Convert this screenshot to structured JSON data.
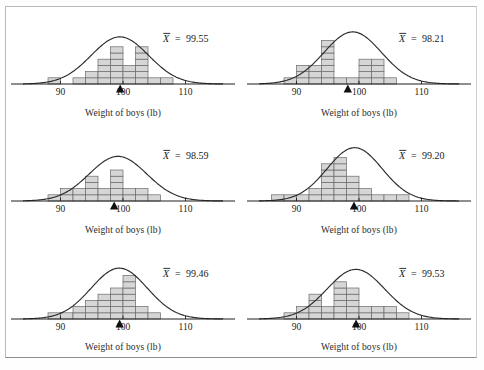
{
  "figure": {
    "axis_label": "Weight of boys (lb)",
    "tick_labels": [
      "90",
      "100",
      "110"
    ],
    "tick_values": [
      90,
      100,
      110
    ],
    "mean_symbol": "X",
    "equals": "=",
    "curve_color": "#2b2b2b",
    "bar_fill": "#d6d6d6",
    "bar_stroke": "#6a6a6a",
    "marker_color": "#111111"
  },
  "chart_data": [
    {
      "type": "bar",
      "title": "",
      "xlabel": "Weight of boys (lb)",
      "ylabel": "",
      "xlim": [
        84,
        116
      ],
      "ticks": [
        90,
        100,
        110
      ],
      "grid": false,
      "mean_label": "99.55",
      "mean": 99.55,
      "bin_width": 2,
      "bin_centers": [
        87,
        89,
        91,
        93,
        95,
        97,
        99,
        101,
        103,
        105,
        107
      ],
      "counts": [
        0,
        1,
        0,
        1,
        2,
        4,
        6,
        3,
        6,
        1,
        1
      ],
      "curve_mean": 99.5,
      "curve_sd": 4.6,
      "curve_peak_units": 7.6
    },
    {
      "type": "bar",
      "title": "",
      "xlabel": "Weight of boys (lb)",
      "ylabel": "",
      "xlim": [
        84,
        116
      ],
      "ticks": [
        90,
        100,
        110
      ],
      "grid": false,
      "mean_label": "98.21",
      "mean": 98.21,
      "bin_width": 2,
      "bin_centers": [
        87,
        89,
        91,
        93,
        95,
        97,
        99,
        101,
        103,
        105,
        107
      ],
      "counts": [
        0,
        1,
        3,
        3,
        7,
        1,
        1,
        4,
        4,
        1,
        0
      ],
      "curve_mean": 99.0,
      "curve_sd": 4.6,
      "curve_peak_units": 8.4
    },
    {
      "type": "bar",
      "title": "",
      "xlabel": "Weight of boys (lb)",
      "ylabel": "",
      "xlim": [
        84,
        116
      ],
      "ticks": [
        90,
        100,
        110
      ],
      "grid": false,
      "mean_label": "98.59",
      "mean": 98.59,
      "bin_width": 2,
      "bin_centers": [
        87,
        89,
        91,
        93,
        95,
        97,
        99,
        101,
        103,
        105,
        107
      ],
      "counts": [
        0,
        1,
        2,
        2,
        4,
        2,
        5,
        2,
        2,
        1,
        0
      ],
      "curve_mean": 99.2,
      "curve_sd": 4.6,
      "curve_peak_units": 7.2
    },
    {
      "type": "bar",
      "title": "",
      "xlabel": "Weight of boys (lb)",
      "ylabel": "",
      "xlim": [
        84,
        116
      ],
      "ticks": [
        90,
        100,
        110
      ],
      "grid": false,
      "mean_label": "99.20",
      "mean": 99.2,
      "bin_width": 2,
      "bin_centers": [
        87,
        89,
        91,
        93,
        95,
        97,
        99,
        101,
        103,
        105,
        107
      ],
      "counts": [
        1,
        1,
        1,
        2,
        6,
        7,
        4,
        2,
        1,
        1,
        1
      ],
      "curve_mean": 99.3,
      "curve_sd": 4.4,
      "curve_peak_units": 8.6
    },
    {
      "type": "bar",
      "title": "",
      "xlabel": "Weight of boys (lb)",
      "ylabel": "",
      "xlim": [
        84,
        116
      ],
      "ticks": [
        90,
        100,
        110
      ],
      "grid": false,
      "mean_label": "99.46",
      "mean": 99.46,
      "bin_width": 2,
      "bin_centers": [
        87,
        89,
        91,
        93,
        95,
        97,
        99,
        101,
        103,
        105,
        107
      ],
      "counts": [
        0,
        1,
        1,
        2,
        3,
        4,
        5,
        7,
        2,
        1,
        0
      ],
      "curve_mean": 99.4,
      "curve_sd": 4.5,
      "curve_peak_units": 8.2
    },
    {
      "type": "bar",
      "title": "",
      "xlabel": "Weight of boys (lb)",
      "ylabel": "",
      "xlim": [
        84,
        116
      ],
      "ticks": [
        90,
        100,
        110
      ],
      "grid": false,
      "mean_label": "99.53",
      "mean": 99.53,
      "bin_width": 2,
      "bin_centers": [
        87,
        89,
        91,
        93,
        95,
        97,
        99,
        101,
        103,
        105,
        107
      ],
      "counts": [
        0,
        1,
        2,
        4,
        2,
        6,
        5,
        2,
        2,
        2,
        1
      ],
      "curve_mean": 99.5,
      "curve_sd": 4.6,
      "curve_peak_units": 8.0
    }
  ]
}
